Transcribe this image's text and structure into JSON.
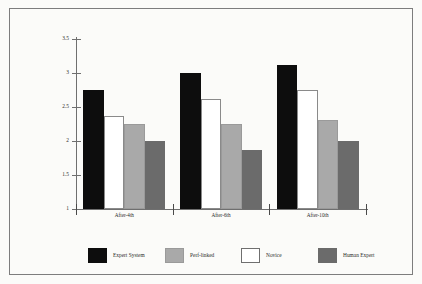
{
  "chart_data": {
    "type": "bar",
    "title": "",
    "xlabel": "",
    "ylabel": "",
    "categories": [
      "After-4th",
      "After-6th",
      "After-10th"
    ],
    "series": [
      {
        "name": "Expert System",
        "color": "#0d0d0d",
        "values": [
          2.75,
          3.0,
          3.12
        ]
      },
      {
        "name": "Novice",
        "color": "#ffffff",
        "values": [
          2.37,
          2.62,
          2.75
        ]
      },
      {
        "name": "Perf-linked",
        "color": "#a9a9a9",
        "values": [
          2.25,
          2.25,
          2.31
        ]
      },
      {
        "name": "Human Expert",
        "color": "#6b6b6b",
        "values": [
          2.0,
          1.87,
          2.0
        ]
      }
    ],
    "ylim": [
      1,
      3.5
    ],
    "ytick_labels": [
      "3.5",
      "3",
      "2.5",
      "2",
      "1.5",
      "1"
    ],
    "ytick_values": [
      3.5,
      3,
      2.5,
      2,
      1.5,
      1
    ],
    "grid": false,
    "legend_position": "bottom",
    "legend_order": [
      "Expert System",
      "Perf-linked",
      "Novice",
      "Human Expert"
    ]
  },
  "legend": {
    "items": [
      {
        "label": "Expert System"
      },
      {
        "label": "Perf-linked"
      },
      {
        "label": "Novice"
      },
      {
        "label": "Human Expert"
      }
    ]
  },
  "colors": {
    "background": "#fbfbf9",
    "frame": "#7d7d7d",
    "axis": "#6f6f6f",
    "text": "#2b2b2b"
  }
}
